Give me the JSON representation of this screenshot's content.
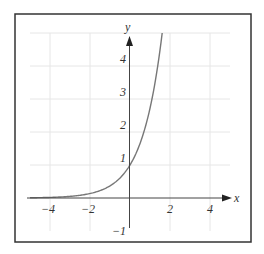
{
  "chart_data": {
    "type": "line",
    "title": "",
    "function": "y = e^x",
    "xlabel": "x",
    "ylabel": "y",
    "xlim": [
      -5,
      5
    ],
    "ylim": [
      -1,
      5
    ],
    "grid": true,
    "legend": null,
    "x_ticks": [
      {
        "value": -4,
        "label": "−4"
      },
      {
        "value": -2,
        "label": "−2"
      },
      {
        "value": 2,
        "label": "2"
      },
      {
        "value": 4,
        "label": "4"
      }
    ],
    "y_ticks": [
      {
        "value": -1,
        "label": "−1"
      },
      {
        "value": 1,
        "label": "1"
      },
      {
        "value": 2,
        "label": "2"
      },
      {
        "value": 3,
        "label": "3"
      },
      {
        "value": 4,
        "label": "4"
      }
    ],
    "series": [
      {
        "name": "e^x",
        "x": [
          -5,
          -4,
          -3,
          -2,
          -1,
          0,
          0.5,
          1,
          1.25,
          1.5,
          1.609
        ],
        "y": [
          0.007,
          0.018,
          0.05,
          0.135,
          0.368,
          1,
          1.649,
          2.718,
          3.49,
          4.482,
          5.0
        ]
      }
    ],
    "colors": {
      "curve": "#777777",
      "axis": "#444444",
      "grid": "#e6e6e6",
      "frame": "#333333"
    }
  }
}
